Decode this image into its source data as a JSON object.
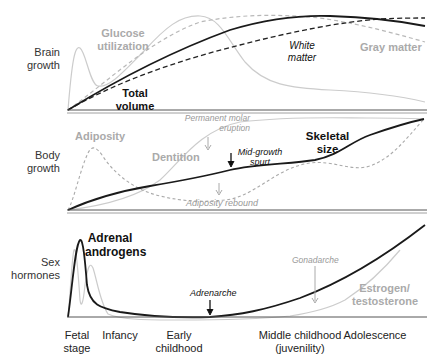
{
  "panels": {
    "brain": {
      "row_label": [
        "Brain",
        "growth"
      ],
      "labels": {
        "glucose": [
          "Glucose",
          "utilization"
        ],
        "total_volume": [
          "Total",
          "volume"
        ],
        "white_matter": [
          "White",
          "matter"
        ],
        "gray_matter": "Gray matter"
      }
    },
    "body": {
      "row_label": [
        "Body",
        "growth"
      ],
      "labels": {
        "adiposity": "Adiposity",
        "dentition": "Dentition",
        "permanent_molar": [
          "Permanent molar",
          "eruption"
        ],
        "mid_growth": [
          "Mid-growth",
          "spurt"
        ],
        "skeletal": [
          "Skeletal",
          "size"
        ],
        "adiposity_rebound": "Adiposity rebound"
      }
    },
    "hormones": {
      "row_label": [
        "Sex",
        "hormones"
      ],
      "labels": {
        "adrenal": [
          "Adrenal",
          "androgens"
        ],
        "adrenarche": "Adrenarche",
        "gonadarche": "Gonadarche",
        "estrogen": [
          "Estrogen/",
          "testosterone"
        ]
      }
    }
  },
  "stages": [
    {
      "label": [
        "Fetal",
        "stage"
      ]
    },
    {
      "label": [
        "Infancy"
      ]
    },
    {
      "label": [
        "Early",
        "childhood"
      ]
    },
    {
      "label": [
        "Middle childhood",
        "(juvenility)"
      ]
    },
    {
      "label": [
        "Adolescence"
      ]
    }
  ],
  "colors": {
    "dark": "#1a1a1a",
    "light_gray": "#c8c8c8",
    "mid_gray": "#aaaaaa",
    "axis": "#555555"
  }
}
